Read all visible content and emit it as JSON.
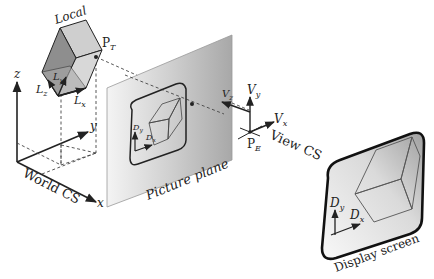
{
  "labels": {
    "local": "Local",
    "pt_main": "P",
    "pt_sub": "T",
    "lz_main": "L",
    "lz_sub": "z",
    "ly_main": "L",
    "ly_sub": "y",
    "lx_main": "L",
    "lx_sub": "x",
    "world_z": "z",
    "world_y": "y",
    "world_x": "x",
    "world_cs": "World CS",
    "picture_plane": "Picture plane",
    "pp_dy_main": "D",
    "pp_dy_sub": "y",
    "pp_dx_main": "D",
    "pp_dx_sub": "x",
    "vz_main": "V",
    "vz_sub": "z",
    "vy_main": "V",
    "vy_sub": "y",
    "vx_main": "V",
    "vx_sub": "x",
    "pe_main": "P",
    "pe_sub": "E",
    "view_cs": "View CS",
    "ds_dy_main": "D",
    "ds_dy_sub": "y",
    "ds_dx_main": "D",
    "ds_dx_sub": "x",
    "display_screen": "Display screen"
  },
  "colors": {
    "ink": "#222222",
    "plane_gray": "#b9b9b9",
    "cube_dark": "#8e8e8e",
    "cube_mid": "#a8a8a8",
    "cube_light": "#d4d4d4"
  }
}
